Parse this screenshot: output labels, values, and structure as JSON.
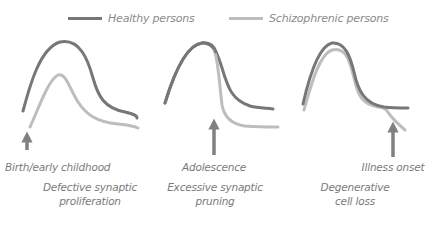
{
  "legend": {
    "healthy": {
      "label": "Healthy persons",
      "color": "#777777"
    },
    "schizophrenic": {
      "label": "Schizophrenic persons",
      "color": "#bdbdbd"
    }
  },
  "panels": [
    {
      "event": "Birth/early childhood",
      "mechanism_line1": "Defective synaptic",
      "mechanism_line2": "proliferation"
    },
    {
      "event": "Adolescence",
      "mechanism_line1": "Excessive synaptic",
      "mechanism_line2": "pruning"
    },
    {
      "event": "Illness onset",
      "mechanism_line1": "Degenerative",
      "mechanism_line2": "cell loss"
    }
  ],
  "arrow_color": "#808080"
}
